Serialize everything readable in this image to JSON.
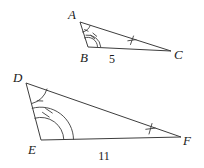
{
  "figure": {
    "kind": "similar-triangles-diagram",
    "background_color": "#ffffff",
    "stroke_color": "#3d3d3d",
    "text_color": "#1a1a1a"
  },
  "triangles": [
    {
      "id": "ABC",
      "name": "upper-triangle",
      "vertices": [
        {
          "key": "A",
          "label": "A",
          "x": 80,
          "y": 22,
          "label_x": 68,
          "label_y": 19
        },
        {
          "key": "B",
          "label": "B",
          "x": 88,
          "y": 47,
          "label_x": 80,
          "label_y": 62
        },
        {
          "key": "C",
          "label": "C",
          "x": 171,
          "y": 51,
          "label_x": 174,
          "label_y": 59
        }
      ],
      "angle_marks": [
        {
          "at": "A",
          "arcs": 1,
          "ticks": 0,
          "name": "angle-a-mark"
        },
        {
          "at": "B",
          "arcs": 2,
          "ticks": 1,
          "name": "angle-b-mark"
        }
      ],
      "side_ticks": [
        {
          "side": "AC",
          "ticks": 1,
          "name": "side-ac-tick"
        }
      ],
      "side_labels": [
        {
          "side": "BC",
          "label": "5",
          "x": 112,
          "y": 63,
          "name": "side-bc-length-label"
        }
      ]
    },
    {
      "id": "DEF",
      "name": "lower-triangle",
      "vertices": [
        {
          "key": "D",
          "label": "D",
          "x": 26,
          "y": 83,
          "label_x": 13,
          "label_y": 82
        },
        {
          "key": "E",
          "label": "E",
          "x": 41,
          "y": 140,
          "label_x": 28,
          "label_y": 154
        },
        {
          "key": "F",
          "label": "F",
          "x": 181,
          "y": 137,
          "label_x": 183,
          "label_y": 145
        }
      ],
      "angle_marks": [
        {
          "at": "D",
          "arcs": 1,
          "ticks": 0,
          "name": "angle-d-mark"
        },
        {
          "at": "E",
          "arcs": 2,
          "ticks": 1,
          "name": "angle-e-mark"
        }
      ],
      "side_ticks": [
        {
          "side": "DF",
          "ticks": 1,
          "name": "side-df-tick"
        }
      ],
      "side_labels": [
        {
          "side": "EF",
          "label": "11",
          "x": 104,
          "y": 160,
          "name": "side-ef-length-label"
        }
      ]
    }
  ],
  "labels": {
    "vertex_a": "A",
    "vertex_b": "B",
    "vertex_c": "C",
    "vertex_d": "D",
    "vertex_e": "E",
    "vertex_f": "F",
    "length_bc": "5",
    "length_ef": "11"
  }
}
